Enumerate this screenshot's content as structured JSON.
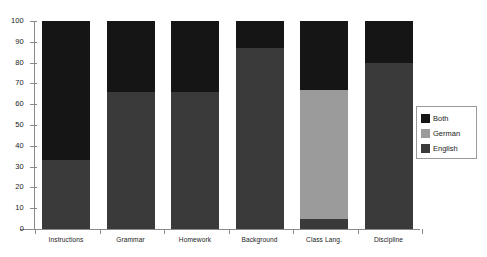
{
  "chart_data": {
    "type": "bar",
    "stacked": true,
    "title": "",
    "xlabel": "",
    "ylabel": "",
    "ylim": [
      0,
      100
    ],
    "yticks": [
      "0",
      "10",
      "20",
      "30",
      "40",
      "50",
      "60",
      "70",
      "80",
      "90",
      "100"
    ],
    "grid": false,
    "legend_position": "right",
    "categories": [
      "Instructions",
      "Grammar",
      "Homework",
      "Background",
      "Class Lang.",
      "Discipline"
    ],
    "series": [
      {
        "name": "English",
        "color": "#3a3a3a",
        "values": [
          33,
          66,
          66,
          87,
          5,
          80
        ]
      },
      {
        "name": "German",
        "color": "#9b9b9b",
        "values": [
          0,
          0,
          0,
          0,
          62,
          0
        ]
      },
      {
        "name": "Both",
        "color": "#151515",
        "values": [
          67,
          34,
          34,
          13,
          33,
          20
        ]
      }
    ]
  },
  "legend": {
    "items": [
      {
        "label": "Both",
        "swatch": "both-swatch"
      },
      {
        "label": "German",
        "swatch": "german-swatch"
      },
      {
        "label": "English",
        "swatch": "english-swatch"
      }
    ]
  }
}
